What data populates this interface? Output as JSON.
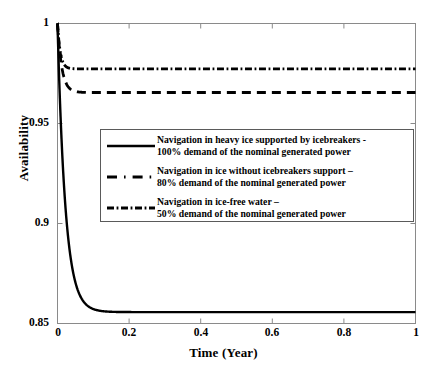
{
  "chart_data": {
    "type": "line",
    "title": "",
    "xlabel": "Time (Year)",
    "ylabel": "Availability",
    "xlim": [
      0,
      1
    ],
    "ylim": [
      0.85,
      1
    ],
    "xticks": [
      "0",
      "0.2",
      "0.4",
      "0.6",
      "0.8",
      "1"
    ],
    "xtick_values": [
      0,
      0.2,
      0.4,
      0.6,
      0.8,
      1
    ],
    "yticks": [
      "0.85",
      "0.9",
      "0.95",
      "1"
    ],
    "ytick_values": [
      0.85,
      0.9,
      0.95,
      1
    ],
    "grid": false,
    "legend_position": "center-left-inside",
    "series": [
      {
        "name": "heavy-ice-icebreakers-100",
        "style": "solid",
        "initial_value": 1.0,
        "steady_value": 0.8557,
        "decay_time_constant": 0.022,
        "x": [
          0,
          0.005,
          0.01,
          0.015,
          0.02,
          0.03,
          0.04,
          0.05,
          0.06,
          0.08,
          0.1,
          0.12,
          0.15,
          0.2,
          0.3,
          0.4,
          0.5,
          0.6,
          0.7,
          0.8,
          0.9,
          1.0
        ],
        "y": [
          1.0,
          0.9716,
          0.9493,
          0.9318,
          0.9181,
          0.8993,
          0.8877,
          0.8806,
          0.8761,
          0.8712,
          0.869,
          0.8678,
          0.8669,
          0.8663,
          0.866,
          0.8659,
          0.8659,
          0.8658,
          0.8558,
          0.8557,
          0.8557,
          0.8557
        ]
      },
      {
        "name": "ice-no-icebreakers-80",
        "style": "dashed",
        "initial_value": 1.0,
        "steady_value": 0.9655,
        "decay_time_constant": 0.012,
        "x": [
          0,
          0.004,
          0.008,
          0.012,
          0.016,
          0.02,
          0.026,
          0.032,
          0.04,
          0.05,
          0.06,
          0.08,
          0.1,
          0.2,
          0.4,
          0.6,
          0.8,
          1.0
        ],
        "y": [
          1.0,
          0.9899,
          0.9818,
          0.976,
          0.9722,
          0.9698,
          0.9677,
          0.9667,
          0.966,
          0.9657,
          0.9656,
          0.9655,
          0.9655,
          0.9655,
          0.9655,
          0.9655,
          0.9655,
          0.9655
        ]
      },
      {
        "name": "ice-free-water-50",
        "style": "dash-dot",
        "initial_value": 1.0,
        "steady_value": 0.9773,
        "decay_time_constant": 0.008,
        "x": [
          0,
          0.003,
          0.006,
          0.009,
          0.012,
          0.016,
          0.02,
          0.026,
          0.032,
          0.04,
          0.05,
          0.06,
          0.08,
          0.1,
          0.2,
          0.4,
          0.6,
          0.8,
          1.0
        ],
        "y": [
          1.0,
          0.9921,
          0.9868,
          0.9831,
          0.9807,
          0.979,
          0.9781,
          0.9776,
          0.9774,
          0.9773,
          0.9773,
          0.9773,
          0.9773,
          0.9773,
          0.9773,
          0.9773,
          0.9773,
          0.9773,
          0.9773
        ]
      }
    ],
    "legend": [
      {
        "style": "solid",
        "line1": "Navigation in heavy ice supported by icebreakers -",
        "line2": "100% demand of the nominal generated power"
      },
      {
        "style": "dashed",
        "line1": "Navigation in ice without icebreakers support –",
        "line2": "80% demand of the nominal generated power"
      },
      {
        "style": "dash-dot",
        "line1": "Navigation in ice-free water –",
        "line2": "50% demand of the nominal generated power"
      }
    ],
    "colors": {
      "line": "#000000",
      "axis": "#808080",
      "background": "#ffffff",
      "legend_border": "#5a5a5a"
    }
  }
}
